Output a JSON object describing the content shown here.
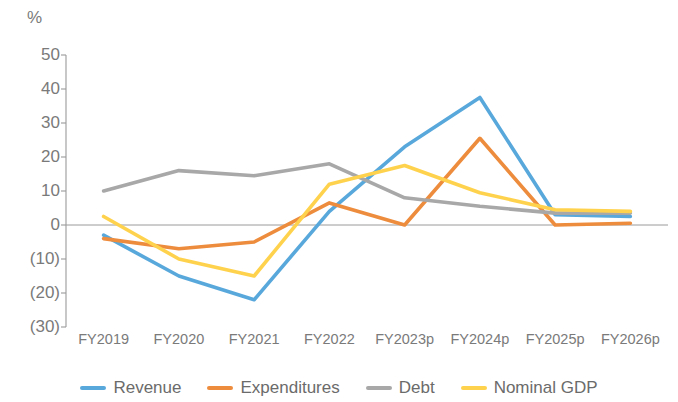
{
  "chart_data": {
    "type": "line",
    "title": "",
    "xlabel": "",
    "ylabel": "%",
    "unit_label": "%",
    "categories": [
      "FY2019",
      "FY2020",
      "FY2021",
      "FY2022",
      "FY2023p",
      "FY2024p",
      "FY2025p",
      "FY2026p"
    ],
    "ylim": [
      -30,
      50
    ],
    "ytick_values": [
      50,
      40,
      30,
      20,
      10,
      0,
      -10,
      -20,
      -30
    ],
    "ytick_labels": [
      "50",
      "40",
      "30",
      "20",
      "10",
      "0",
      "(10)",
      "(20)",
      "(30)"
    ],
    "grid": false,
    "zero_line": true,
    "legend_position": "bottom",
    "series": [
      {
        "name": "Revenue",
        "color": "#59A8DC",
        "values": [
          -3,
          -15,
          -22,
          4,
          23,
          37.5,
          3,
          2.5
        ]
      },
      {
        "name": "Expenditures",
        "color": "#ED8C3C",
        "values": [
          -4,
          -7,
          -5,
          6.5,
          0,
          25.5,
          0,
          0.5
        ]
      },
      {
        "name": "Debt",
        "color": "#A8A8A8",
        "values": [
          10,
          16,
          14.5,
          18,
          8,
          5.5,
          3.5,
          3.5
        ]
      },
      {
        "name": "Nominal GDP",
        "color": "#FFD24D",
        "values": [
          2.5,
          -10,
          -15,
          12,
          17.5,
          9.5,
          4.5,
          4
        ]
      }
    ]
  },
  "axis": {
    "unit": "%"
  },
  "colors": {
    "revenue": "#59A8DC",
    "expenditures": "#ED8C3C",
    "debt": "#A8A8A8",
    "nominal_gdp": "#FFD24D",
    "axis_text": "#7a7a7a",
    "axis_line": "#9a9a9a"
  }
}
